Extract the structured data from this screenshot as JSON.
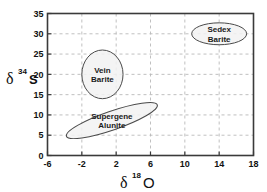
{
  "chart_data": {
    "type": "scatter",
    "title": "",
    "xlabel": "δ 18 O",
    "ylabel": "δ 34 S",
    "xlabel_symbol": "δ",
    "xlabel_sup": "18",
    "xlabel_element": "O",
    "ylabel_symbol": "δ",
    "ylabel_sup": "34",
    "ylabel_element": "S",
    "xlim": [
      -6,
      18
    ],
    "ylim": [
      0,
      35
    ],
    "xticks": [
      -6,
      -2,
      2,
      6,
      10,
      14,
      18
    ],
    "yticks": [
      0,
      5,
      10,
      15,
      20,
      25,
      30,
      35
    ],
    "xtick_labels": [
      "-6",
      "-2",
      "2",
      "6",
      "10",
      "14",
      "18"
    ],
    "ytick_labels": [
      "0",
      "5",
      "10",
      "15",
      "20",
      "25",
      "30",
      "35"
    ],
    "grid": true,
    "grid_style": "dashed",
    "grid_color": "#b9b9b9",
    "frame_color": "#3a3a3a",
    "background": "#ffffff",
    "legend": "none",
    "series": [
      {
        "name": "Sedex Barite",
        "label_lines": [
          "Sedex",
          "Barite"
        ],
        "shape": "ellipse",
        "center": [
          14.0,
          30.0
        ],
        "radius_x": 3.2,
        "radius_y": 2.7,
        "rotation": 0,
        "fill": "#f2f2f2",
        "stroke": "#4a4a4a"
      },
      {
        "name": "Vein Barite",
        "label_lines": [
          "Vein",
          "Barite"
        ],
        "shape": "ellipse",
        "center": [
          0.4,
          20.0
        ],
        "radius_x": 2.4,
        "radius_y": 6.0,
        "rotation": 0,
        "fill": "#f2f2f2",
        "stroke": "#4a4a4a"
      },
      {
        "name": "Supergene Alunite",
        "label_lines": [
          "Supergene",
          "Alunite"
        ],
        "shape": "ellipse",
        "center": [
          1.5,
          8.6
        ],
        "radius_x": 5.6,
        "radius_y": 2.3,
        "rotation": -19,
        "fill": "#f2f2f2",
        "stroke": "#4a4a4a"
      }
    ]
  }
}
